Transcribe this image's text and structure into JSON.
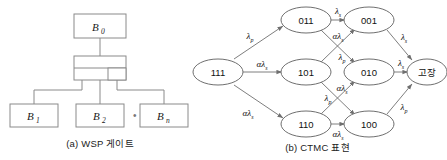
{
  "figure": {
    "panel_a": {
      "caption": "(a) WSP 게이트",
      "top_box": {
        "label": "B",
        "sub": "0"
      },
      "gate": {
        "name": "wsp-gate-symbol"
      },
      "children": [
        {
          "label": "B",
          "sub": "1"
        },
        {
          "label": "B",
          "sub": "2"
        },
        {
          "label": "B",
          "sub": "n"
        }
      ],
      "ellipsis": "• • • • •"
    },
    "panel_b": {
      "caption": "(b) CTMC 표현",
      "nodes": [
        {
          "id": "n111",
          "label": "111",
          "x": 30,
          "y": 72
        },
        {
          "id": "n011",
          "label": "011",
          "x": 118,
          "y": 20
        },
        {
          "id": "n101",
          "label": "101",
          "x": 118,
          "y": 72
        },
        {
          "id": "n110",
          "label": "110",
          "x": 118,
          "y": 124
        },
        {
          "id": "n001",
          "label": "001",
          "x": 181,
          "y": 20
        },
        {
          "id": "n010",
          "label": "010",
          "x": 181,
          "y": 72
        },
        {
          "id": "n100",
          "label": "100",
          "x": 181,
          "y": 124
        },
        {
          "id": "nfail",
          "label": "고장",
          "x": 239,
          "y": 72
        }
      ],
      "edges": [
        {
          "from": "111",
          "to": "011",
          "label": "λ",
          "sub": "p",
          "lx": 62,
          "ly": 36
        },
        {
          "from": "111",
          "to": "101",
          "label": "αλ",
          "sub": "s",
          "lx": 74,
          "ly": 64
        },
        {
          "from": "111",
          "to": "110",
          "label": "αλ",
          "sub": "s",
          "lx": 62,
          "ly": 113
        },
        {
          "from": "011",
          "to": "001",
          "label": "λ",
          "sub": "s",
          "lx": 150,
          "ly": 12
        },
        {
          "from": "011",
          "to": "010",
          "label": "αλ",
          "sub": "s",
          "lx": 150,
          "ly": 36
        },
        {
          "from": "101",
          "to": "001",
          "label": "λ",
          "sub": "p",
          "lx": 152,
          "ly": 60
        },
        {
          "from": "101",
          "to": "100",
          "label": "λ",
          "sub": "p",
          "lx": 143,
          "ly": 100
        },
        {
          "from": "110",
          "to": "010",
          "label": "αλ",
          "sub": "s",
          "lx": 152,
          "ly": 90
        },
        {
          "from": "110",
          "to": "100",
          "label": "αλ",
          "sub": "s",
          "lx": 150,
          "ly": 140
        },
        {
          "from": "001",
          "to": "고장",
          "label": "λ",
          "sub": "s",
          "lx": 214,
          "ly": 40
        },
        {
          "from": "010",
          "to": "고장",
          "label": "λ",
          "sub": "s",
          "lx": 214,
          "ly": 64
        },
        {
          "from": "100",
          "to": "고장",
          "label": "λ",
          "sub": "p",
          "lx": 214,
          "ly": 110
        }
      ]
    }
  },
  "colors": {
    "stroke": "#6f6f6f",
    "box_stroke": "#8a8a8a",
    "text": "#1a1a1a",
    "background": "#ffffff"
  }
}
